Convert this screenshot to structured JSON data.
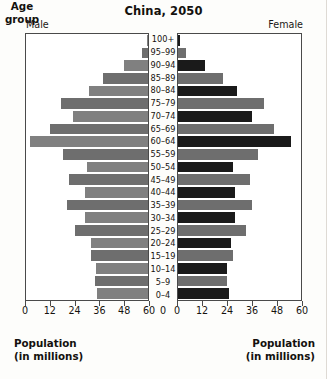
{
  "chart_data": {
    "type": "bar",
    "subtype": "population-pyramid",
    "title": "China, 2050",
    "xlabel": "Population (in millions)",
    "ylabel": "Age group",
    "grid": false,
    "legend_position": "none",
    "axis_max": 60,
    "xticks": [
      0,
      12,
      24,
      36,
      48,
      60
    ],
    "left_tick_labels": [
      "60",
      "48",
      "36",
      "24",
      "12",
      "0"
    ],
    "right_tick_labels": [
      "0",
      "12",
      "24",
      "36",
      "48",
      "60"
    ],
    "left_panel_label": "Male",
    "right_panel_label": "Female",
    "categories": [
      "0–4",
      "5–9",
      "10–14",
      "15–19",
      "20–24",
      "25–29",
      "30–34",
      "35–39",
      "40–44",
      "45–49",
      "50–54",
      "55–59",
      "60–64",
      "65–69",
      "70–74",
      "75–79",
      "80–84",
      "85–89",
      "90–94",
      "95–99",
      "100+"
    ],
    "series": [
      {
        "name": "Male",
        "side": "left",
        "values": [
          25,
          26,
          25.5,
          28,
          28,
          36,
          31,
          40,
          31,
          39,
          30,
          42,
          58,
          48,
          37,
          43,
          29,
          22,
          12,
          3,
          0.4
        ]
      },
      {
        "name": "Female",
        "side": "right",
        "values": [
          25,
          24,
          24,
          27,
          26,
          33,
          28,
          36,
          28,
          35,
          27,
          39,
          55,
          47,
          36,
          42,
          29,
          22,
          13,
          4,
          1
        ]
      }
    ]
  },
  "colors": {
    "male_band_a": "#808080",
    "male_band_b": "#6e6e6e",
    "female_band_a": "#1a1a1a",
    "female_band_b": "#6e6e6e",
    "panel_background": "#ffffff",
    "panel_border": "#4a4a4a",
    "page_background": "#fdfdfb",
    "text": "#14110e"
  },
  "captions": {
    "male_axis_line1": "Population",
    "male_axis_line2": "(in millions)",
    "female_axis_line1": "Population",
    "female_axis_line2": "(in millions)",
    "age_line1": "Age",
    "age_line2": "group",
    "centre_zero_left": "0",
    "centre_zero_right": "0"
  }
}
